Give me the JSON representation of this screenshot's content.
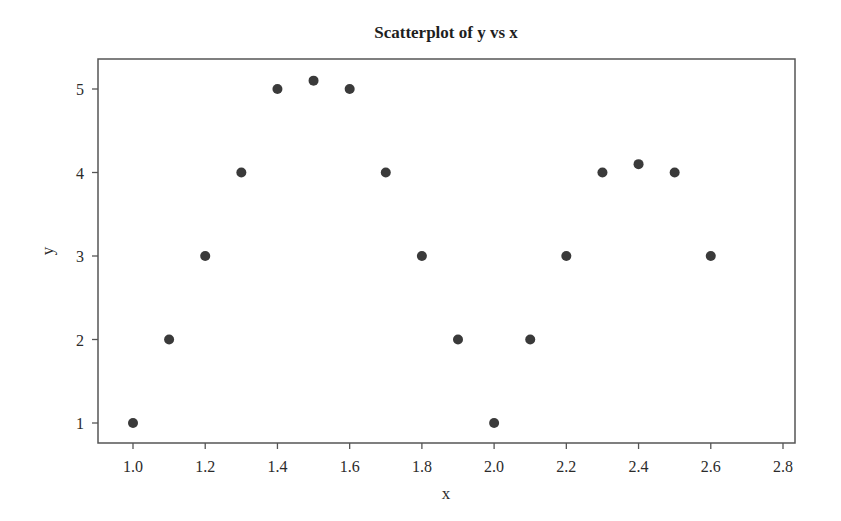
{
  "chart_data": {
    "type": "scatter",
    "title": "Scatterplot of y vs x",
    "xlabel": "x",
    "ylabel": "y",
    "xlim": [
      0.9,
      2.83
    ],
    "ylim": [
      0.78,
      5.35
    ],
    "xticks": [
      1.0,
      1.2,
      1.4,
      1.6,
      1.8,
      2.0,
      2.2,
      2.4,
      2.6,
      2.8
    ],
    "xtick_labels": [
      "1.0",
      "1.2",
      "1.4",
      "1.6",
      "1.8",
      "2.0",
      "2.2",
      "2.4",
      "2.6",
      "2.8"
    ],
    "yticks": [
      1,
      2,
      3,
      4,
      5
    ],
    "ytick_labels": [
      "1",
      "2",
      "3",
      "4",
      "5"
    ],
    "grid": false,
    "legend": null,
    "series": [
      {
        "name": "y vs x",
        "color": "#3a3a3a",
        "x": [
          1.0,
          1.1,
          1.2,
          1.3,
          1.4,
          1.5,
          1.6,
          1.7,
          1.8,
          1.9,
          2.0,
          2.1,
          2.2,
          2.3,
          2.4,
          2.5,
          2.6
        ],
        "y": [
          1,
          2,
          3,
          4,
          5,
          5.1,
          5,
          4,
          3,
          2,
          1,
          2,
          3,
          4,
          4.1,
          4,
          3
        ]
      }
    ]
  },
  "colors": {
    "frame": "#555555",
    "marker": "#3a3a3a",
    "text": "#2b2b2b"
  }
}
